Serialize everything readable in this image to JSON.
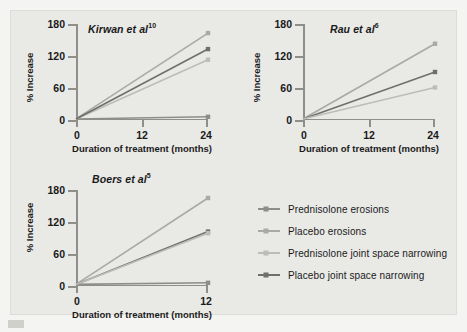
{
  "figure": {
    "background_color": "#e9e9e6",
    "page_color": "#f4f4f2"
  },
  "axes": {
    "ylabel": "% Increase",
    "xlabel": "Duration of treatment (months)",
    "yticks": [
      "0",
      "60",
      "120",
      "180"
    ],
    "xticks_24": [
      "0",
      "12",
      "24"
    ],
    "xticks_12": [
      "0",
      "12"
    ]
  },
  "legend": {
    "items": [
      {
        "label": "Prednisolone erosions",
        "color": "#8d8d8a",
        "marker": "square"
      },
      {
        "label": "Placebo erosions",
        "color": "#a9a9a5",
        "marker": "square"
      },
      {
        "label": "Prednisolone joint space narrowing",
        "color": "#bcbcb8",
        "marker": "square"
      },
      {
        "label": "Placebo joint space narrowing",
        "color": "#6f6f6c",
        "marker": "square"
      }
    ]
  },
  "chart_data": [
    {
      "type": "line",
      "title": "Kirwan et al",
      "title_ref": "10",
      "xlabel": "Duration of treatment (months)",
      "ylabel": "% Increase",
      "xlim": [
        0,
        24
      ],
      "ylim": [
        0,
        180
      ],
      "xticks": [
        0,
        12,
        24
      ],
      "yticks": [
        0,
        60,
        120,
        180
      ],
      "grid": false,
      "legend_position": "external-right",
      "series": [
        {
          "name": "Prednisolone erosions",
          "color": "#8d8d8a",
          "x": [
            0,
            24
          ],
          "values": [
            2,
            6
          ]
        },
        {
          "name": "Placebo erosions",
          "color": "#a9a9a5",
          "x": [
            0,
            24
          ],
          "values": [
            2,
            163
          ]
        },
        {
          "name": "Prednisolone joint space narrowing",
          "color": "#bcbcb8",
          "x": [
            0,
            24
          ],
          "values": [
            2,
            113
          ]
        },
        {
          "name": "Placebo joint space narrowing",
          "color": "#6f6f6c",
          "x": [
            0,
            24
          ],
          "values": [
            2,
            133
          ]
        }
      ]
    },
    {
      "type": "line",
      "title": "Rau et al",
      "title_ref": "6",
      "xlabel": "Duration of treatment (months)",
      "ylabel": "% Increase",
      "xlim": [
        0,
        24
      ],
      "ylim": [
        0,
        180
      ],
      "xticks": [
        0,
        12,
        24
      ],
      "yticks": [
        0,
        60,
        120,
        180
      ],
      "grid": false,
      "legend_position": "external-right",
      "series": [
        {
          "name": "Placebo erosions",
          "color": "#a9a9a5",
          "x": [
            0,
            24
          ],
          "values": [
            2,
            143
          ]
        },
        {
          "name": "Placebo joint space narrowing",
          "color": "#6f6f6c",
          "x": [
            0,
            24
          ],
          "values": [
            2,
            90
          ]
        },
        {
          "name": "Prednisolone joint space narrowing",
          "color": "#bcbcb8",
          "x": [
            0,
            24
          ],
          "values": [
            2,
            61
          ]
        }
      ]
    },
    {
      "type": "line",
      "title": "Boers et al",
      "title_ref": "5",
      "xlabel": "Duration of treatment (months)",
      "ylabel": "% Increase",
      "xlim": [
        0,
        12
      ],
      "ylim": [
        0,
        180
      ],
      "xticks": [
        0,
        12
      ],
      "yticks": [
        0,
        60,
        120,
        180
      ],
      "grid": false,
      "legend_position": "external-right",
      "series": [
        {
          "name": "Prednisolone erosions",
          "color": "#8d8d8a",
          "x": [
            0,
            12
          ],
          "values": [
            3,
            6
          ]
        },
        {
          "name": "Placebo erosions",
          "color": "#a9a9a5",
          "x": [
            0,
            12
          ],
          "values": [
            3,
            165
          ]
        },
        {
          "name": "Placebo joint space narrowing",
          "color": "#6f6f6c",
          "x": [
            0,
            12
          ],
          "values": [
            3,
            102
          ]
        },
        {
          "name": "Prednisolone joint space narrowing",
          "color": "#bcbcb8",
          "x": [
            0,
            12
          ],
          "values": [
            3,
            99
          ]
        }
      ]
    }
  ]
}
